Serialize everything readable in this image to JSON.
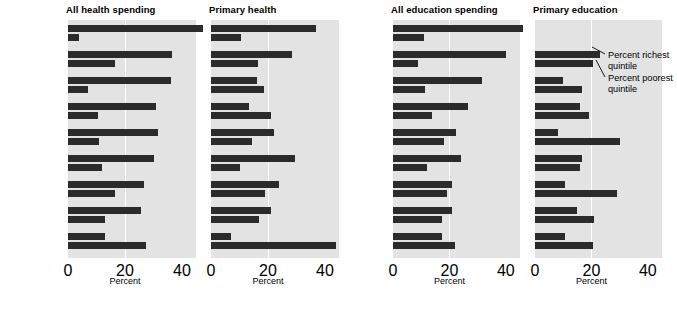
{
  "figure": {
    "axis_label": "Percent",
    "ticks": [
      "0",
      "20",
      "40"
    ],
    "tick_values": [
      0,
      20,
      40
    ],
    "xlim": [
      0,
      40
    ],
    "bar_color": "#2b2b2b",
    "plot_bg": "#e3e3e3",
    "gridline_color": "#ffffff"
  },
  "annotations": [
    {
      "name": "richest-annotation",
      "line1": "Percent richest",
      "line2": "quintile"
    },
    {
      "name": "poorest-annotation",
      "line1": "Percent poorest",
      "line2": "quintile"
    }
  ],
  "panels": [
    {
      "title": "All health spending",
      "rows": [
        {
          "name": "Guinea",
          "year": "1994",
          "richest": 47.5,
          "poorest": 4.0
        },
        {
          "name": "Armenia",
          "year": "1999",
          "richest": 36.5,
          "poorest": 16.5
        },
        {
          "name": "Ecuador",
          "year": "1998",
          "richest": 36.0,
          "poorest": 7.0
        },
        {
          "name": "India",
          "year": "1995/96",
          "richest": 31.0,
          "poorest": 10.5
        },
        {
          "name": "Côte d'Ivoire",
          "year": "1995",
          "richest": 31.5,
          "poorest": 11.0
        },
        {
          "name": "Madagascar",
          "year": "1993",
          "richest": 30.0,
          "poorest": 12.0
        },
        {
          "name": "Bangladesh",
          "year": "2000",
          "richest": 26.5,
          "poorest": 16.5
        },
        {
          "name": "Bulgaria",
          "year": "1995",
          "richest": 25.5,
          "poorest": 13.0
        },
        {
          "name": "Costa Rica",
          "year": "1992",
          "richest": 13.0,
          "poorest": 27.5
        }
      ]
    },
    {
      "title": "Primary health",
      "rows": [
        {
          "richest": 37.0,
          "poorest": 10.5
        },
        {
          "richest": 28.5,
          "poorest": 16.5
        },
        {
          "richest": 16.0,
          "poorest": 18.5
        },
        {
          "richest": 13.5,
          "poorest": 21.0
        },
        {
          "richest": 22.0,
          "poorest": 14.5
        },
        {
          "richest": 29.5,
          "poorest": 10.0
        },
        {
          "richest": 24.0,
          "poorest": 19.0
        },
        {
          "richest": 21.0,
          "poorest": 17.0
        },
        {
          "richest": 7.0,
          "poorest": 44.0
        }
      ]
    },
    {
      "title": "All education spending",
      "rows": [
        {
          "name": "Nepal",
          "year": "1996",
          "richest": 46.0,
          "poorest": 11.0
        },
        {
          "name": "Kosovo",
          "year": "2000",
          "richest": 40.0,
          "poorest": 9.0
        },
        {
          "name": "Nicaragua",
          "year": "1998",
          "richest": 31.5,
          "poorest": 11.5
        },
        {
          "name": "Cambodia",
          "year": "1996/97",
          "richest": 26.5,
          "poorest": 14.0
        },
        {
          "name": "Brazil 1997",
          "year": "(NE&SE)",
          "richest": 22.5,
          "poorest": 18.0
        },
        {
          "name": "Morocco",
          "year": "1998/99",
          "richest": 24.0,
          "poorest": 12.0
        },
        {
          "name": "Mexico",
          "year": "1996",
          "richest": 21.0,
          "poorest": 19.0
        },
        {
          "name": "Kenya",
          "year": "1992",
          "richest": 21.0,
          "poorest": 17.5
        },
        {
          "name": "Romania",
          "year": "1994",
          "richest": 17.5,
          "poorest": 22.0
        }
      ]
    },
    {
      "title": "Primary education",
      "rows": [
        {
          "richest": null,
          "poorest": null
        },
        {
          "richest": 23.0,
          "poorest": 20.5
        },
        {
          "richest": 10.0,
          "poorest": 16.5
        },
        {
          "richest": 16.0,
          "poorest": 19.0
        },
        {
          "richest": 8.0,
          "poorest": 30.0
        },
        {
          "richest": 16.5,
          "poorest": 16.0
        },
        {
          "richest": 10.5,
          "poorest": 29.0
        },
        {
          "richest": 15.0,
          "poorest": 21.0
        },
        {
          "richest": 10.5,
          "poorest": 20.5
        }
      ]
    }
  ],
  "chart_data": {
    "type": "bar",
    "title": "",
    "xlabel": "Percent",
    "ylabel": "",
    "xlim": [
      0,
      40
    ],
    "grid": true,
    "legend_position": "inline-annotation",
    "series": [
      {
        "name": "Percent richest quintile"
      },
      {
        "name": "Percent poorest quintile"
      }
    ],
    "panels": [
      {
        "panel": "All health spending",
        "categories": [
          "Guinea 1994",
          "Armenia 1999",
          "Ecuador 1998",
          "India 1995/96",
          "Côte d'Ivoire 1995",
          "Madagascar 1993",
          "Bangladesh 2000",
          "Bulgaria 1995",
          "Costa Rica 1992"
        ],
        "richest": [
          47.5,
          36.5,
          36.0,
          31.0,
          31.5,
          30.0,
          26.5,
          25.5,
          13.0
        ],
        "poorest": [
          4.0,
          16.5,
          7.0,
          10.5,
          11.0,
          12.0,
          16.5,
          13.0,
          27.5
        ]
      },
      {
        "panel": "Primary health",
        "categories": [
          "Guinea 1994",
          "Armenia 1999",
          "Ecuador 1998",
          "India 1995/96",
          "Côte d'Ivoire 1995",
          "Madagascar 1993",
          "Bangladesh 2000",
          "Bulgaria 1995",
          "Costa Rica 1992"
        ],
        "richest": [
          37.0,
          28.5,
          16.0,
          13.5,
          22.0,
          29.5,
          24.0,
          21.0,
          7.0
        ],
        "poorest": [
          10.5,
          16.5,
          18.5,
          21.0,
          14.5,
          10.0,
          19.0,
          17.0,
          44.0
        ]
      },
      {
        "panel": "All education spending",
        "categories": [
          "Nepal 1996",
          "Kosovo 2000",
          "Nicaragua 1998",
          "Cambodia 1996/97",
          "Brazil 1997 (NE&SE)",
          "Morocco 1998/99",
          "Mexico 1996",
          "Kenya 1992",
          "Romania 1994"
        ],
        "richest": [
          46.0,
          40.0,
          31.5,
          26.5,
          22.5,
          24.0,
          21.0,
          21.0,
          17.5
        ],
        "poorest": [
          11.0,
          9.0,
          11.5,
          14.0,
          18.0,
          12.0,
          19.0,
          17.5,
          22.0
        ]
      },
      {
        "panel": "Primary education",
        "categories": [
          "Nepal 1996",
          "Kosovo 2000",
          "Nicaragua 1998",
          "Cambodia 1996/97",
          "Brazil 1997 (NE&SE)",
          "Morocco 1998/99",
          "Mexico 1996",
          "Kenya 1992",
          "Romania 1994"
        ],
        "richest": [
          null,
          23.0,
          10.0,
          16.0,
          8.0,
          16.5,
          10.5,
          15.0,
          10.5
        ],
        "poorest": [
          null,
          20.5,
          16.5,
          19.0,
          30.0,
          16.0,
          29.0,
          21.0,
          20.5
        ]
      }
    ]
  }
}
